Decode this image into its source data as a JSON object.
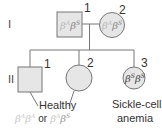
{
  "generations": [
    "I",
    "II"
  ],
  "gen_I": {
    "individual_1": {
      "number": "1",
      "shape": "square",
      "genotype_a": "β",
      "sup_a": "A",
      "genotype_b": "β",
      "sup_b": "S"
    },
    "individual_2": {
      "number": "2",
      "shape": "circle",
      "genotype_a": "β",
      "sup_a": "A",
      "genotype_b": "β",
      "sup_b": "S"
    }
  },
  "gen_II": {
    "individual_1": {
      "number": "1",
      "shape": "square"
    },
    "individual_2": {
      "number": "2",
      "shape": "circle"
    },
    "individual_3": {
      "number": "3",
      "shape": "circle",
      "genotype_a": "β",
      "sup_a": "S",
      "genotype_b": "β",
      "sup_b": "S"
    }
  },
  "labels": {
    "healthy": "Healthy",
    "healthy_genotypes": {
      "g1a": "β",
      "s1a": "A",
      "g1b": "β",
      "s1b": "A",
      "or": "or",
      "g2a": "β",
      "s2a": "A",
      "g2b": "β",
      "s2b": "S"
    },
    "affected_line1": "Sickle-cell",
    "affected_line2": "anemia"
  },
  "colors": {
    "fill": "#e6e6e6",
    "stroke": "#777777",
    "carrier_text": "#b8b8b8",
    "affected_text": "#444444"
  }
}
